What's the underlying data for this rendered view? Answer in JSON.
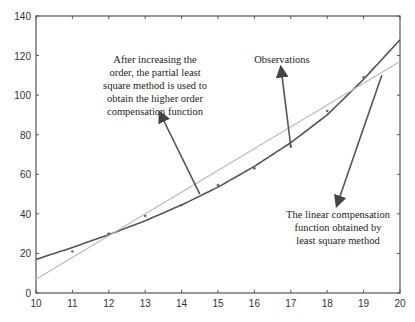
{
  "chart_data": {
    "type": "line",
    "title": "",
    "xlabel": "",
    "ylabel": "",
    "xlim": [
      10,
      20
    ],
    "ylim": [
      0,
      140
    ],
    "grid": false,
    "x_ticks": [
      10,
      11,
      12,
      13,
      14,
      15,
      16,
      17,
      18,
      19,
      20
    ],
    "y_ticks": [
      0,
      20,
      40,
      60,
      80,
      100,
      120,
      140
    ],
    "series": [
      {
        "name": "Observations",
        "style": "points",
        "color": "#666666",
        "x": [
          11,
          12,
          13,
          14,
          15,
          16,
          17,
          18,
          19
        ],
        "y": [
          21,
          30,
          39,
          44.5,
          54.5,
          63,
          74,
          92,
          109
        ]
      },
      {
        "name": "Higher order compensation function (partial least squares)",
        "style": "curve",
        "color": "#555555",
        "x": [
          10,
          11,
          12,
          13,
          14,
          15,
          16,
          17,
          18,
          19,
          20
        ],
        "y": [
          17,
          23,
          29.5,
          36.5,
          44.5,
          53.5,
          64,
          76,
          90,
          108,
          128
        ]
      },
      {
        "name": "Linear compensation function (least squares)",
        "style": "line",
        "color": "#bbbbbb",
        "x": [
          10,
          20
        ],
        "y": [
          7,
          117
        ]
      }
    ],
    "annotations": [
      {
        "text": [
          "After increasing the",
          "order, the partial least",
          "square method is used to",
          "obtain the higher order",
          "compensation function"
        ],
        "arrow_to": [
          14.5,
          50
        ]
      },
      {
        "text": [
          "Observations"
        ],
        "arrow_to": [
          17,
          74
        ]
      },
      {
        "text": [
          "The linear compensation",
          "function obtained by",
          "least square method"
        ],
        "arrow_from": [
          19.5,
          110
        ]
      }
    ]
  }
}
